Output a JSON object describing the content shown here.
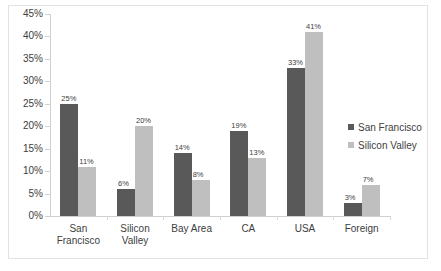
{
  "chart_data": {
    "type": "bar",
    "title": "",
    "xlabel": "",
    "ylabel": "",
    "ylim": [
      0,
      45
    ],
    "ytick_step": 5,
    "grid": false,
    "legend_position": "right",
    "categories": [
      "San Francisco",
      "Silicon Valley",
      "Bay Area",
      "CA",
      "USA",
      "Foreign"
    ],
    "category_lines": [
      [
        "San",
        "Francisco"
      ],
      [
        "Silicon",
        "Valley"
      ],
      [
        "Bay Area"
      ],
      [
        "CA"
      ],
      [
        "USA"
      ],
      [
        "Foreign"
      ]
    ],
    "ytick_labels": [
      "0%",
      "5%",
      "10%",
      "15%",
      "20%",
      "25%",
      "30%",
      "35%",
      "40%",
      "45%"
    ],
    "ytick_values": [
      0,
      5,
      10,
      15,
      20,
      25,
      30,
      35,
      40,
      45
    ],
    "series": [
      {
        "name": "San Francisco",
        "color": "#595959",
        "values": [
          25,
          6,
          14,
          19,
          33,
          3
        ],
        "labels": [
          "25%",
          "6%",
          "14%",
          "19%",
          "33%",
          "3%"
        ]
      },
      {
        "name": "Silicon Valley",
        "color": "#bfbfbf",
        "values": [
          11,
          20,
          8,
          13,
          41,
          7
        ],
        "labels": [
          "11%",
          "20%",
          "8%",
          "13%",
          "41%",
          "7%"
        ]
      }
    ]
  },
  "legend": {
    "items": [
      {
        "label": "San Francisco",
        "color": "#595959"
      },
      {
        "label": "Silicon Valley",
        "color": "#bfbfbf"
      }
    ]
  }
}
